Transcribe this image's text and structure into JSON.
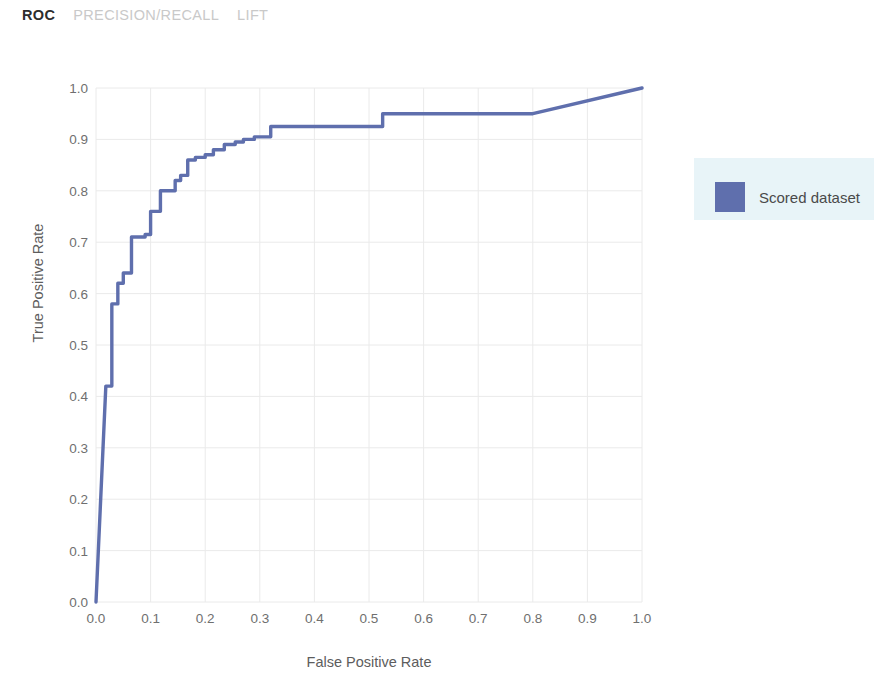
{
  "tabs": [
    {
      "label": "ROC",
      "active": true
    },
    {
      "label": "PRECISION/RECALL",
      "active": false
    },
    {
      "label": "LIFT",
      "active": false
    }
  ],
  "legend": {
    "series_label": "Scored dataset",
    "swatch_color": "#5f6fad"
  },
  "colors": {
    "curve": "#5f6fad",
    "grid": "#eaeaea",
    "tick_text": "#6f6f6f",
    "axis_title": "#5d5d5d",
    "tab_active": "#2d2d2d",
    "tab_inactive": "#c9c9c9",
    "legend_band": "#e8f4f8",
    "background": "#ffffff"
  },
  "chart_data": {
    "type": "line",
    "title": "",
    "subtitle": "",
    "xlabel": "False Positive Rate",
    "ylabel": "True Positive Rate",
    "xlim": [
      0.0,
      1.0
    ],
    "ylim": [
      0.0,
      1.0
    ],
    "grid": true,
    "legend_position": "right",
    "xticks": [
      "0.0",
      "0.1",
      "0.2",
      "0.3",
      "0.4",
      "0.5",
      "0.6",
      "0.7",
      "0.8",
      "0.9",
      "1.0"
    ],
    "yticks": [
      "0.0",
      "0.1",
      "0.2",
      "0.3",
      "0.4",
      "0.5",
      "0.6",
      "0.7",
      "0.8",
      "0.9",
      "1.0"
    ],
    "xtick_values": [
      0.0,
      0.1,
      0.2,
      0.3,
      0.4,
      0.5,
      0.6,
      0.7,
      0.8,
      0.9,
      1.0
    ],
    "ytick_values": [
      0.0,
      0.1,
      0.2,
      0.3,
      0.4,
      0.5,
      0.6,
      0.7,
      0.8,
      0.9,
      1.0
    ],
    "series": [
      {
        "name": "Scored dataset",
        "color": "#5f6fad",
        "x": [
          0.0,
          0.018,
          0.018,
          0.029,
          0.029,
          0.04,
          0.04,
          0.05,
          0.05,
          0.065,
          0.065,
          0.09,
          0.09,
          0.1,
          0.1,
          0.118,
          0.118,
          0.145,
          0.145,
          0.155,
          0.155,
          0.168,
          0.168,
          0.182,
          0.182,
          0.2,
          0.2,
          0.215,
          0.215,
          0.235,
          0.235,
          0.255,
          0.255,
          0.27,
          0.27,
          0.29,
          0.29,
          0.32,
          0.32,
          0.525,
          0.525,
          0.8,
          1.0
        ],
        "y": [
          0.0,
          0.42,
          0.42,
          0.42,
          0.58,
          0.58,
          0.62,
          0.62,
          0.64,
          0.64,
          0.71,
          0.71,
          0.715,
          0.715,
          0.76,
          0.76,
          0.8,
          0.8,
          0.82,
          0.82,
          0.83,
          0.83,
          0.86,
          0.86,
          0.865,
          0.865,
          0.87,
          0.87,
          0.88,
          0.88,
          0.89,
          0.89,
          0.895,
          0.895,
          0.9,
          0.9,
          0.905,
          0.905,
          0.925,
          0.925,
          0.95,
          0.95,
          1.0
        ]
      }
    ]
  }
}
